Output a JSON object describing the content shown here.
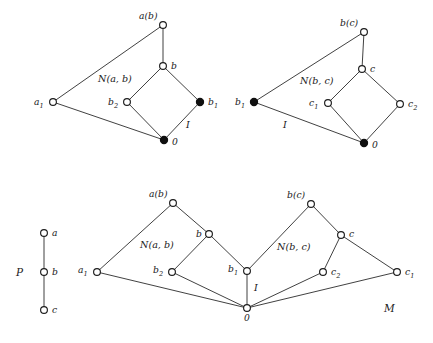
{
  "figure": {
    "background_color": "#ffffff",
    "line_color": "#2b2b2b",
    "node_open_fill": "#ffffff",
    "node_filled_fill": "#101010"
  },
  "chart_data": {
    "type": "diagram",
    "panels": [
      {
        "id": "panel-nab",
        "region_label": "N(a, b)",
        "interval_label": "I",
        "nodes": [
          {
            "id": "ab",
            "label": "a(b)",
            "x": 163,
            "y": 25,
            "filled": false,
            "label_dx": -24,
            "label_dy": -6
          },
          {
            "id": "b",
            "label": "b",
            "x": 163,
            "y": 66,
            "filled": false,
            "label_dx": 8,
            "label_dy": 3
          },
          {
            "id": "b2",
            "label": "b2",
            "x": 127,
            "y": 102,
            "filled": false,
            "label_dx": -19,
            "label_dy": 3
          },
          {
            "id": "b1",
            "label": "b1",
            "x": 200,
            "y": 102,
            "filled": true,
            "label_dx": 8,
            "label_dy": 3
          },
          {
            "id": "zero",
            "label": "0",
            "x": 164,
            "y": 140,
            "filled": true,
            "label_dx": 8,
            "label_dy": 5
          },
          {
            "id": "a1",
            "label": "a1",
            "x": 53,
            "y": 102,
            "filled": false,
            "label_dx": -19,
            "label_dy": 3
          }
        ],
        "edges": [
          [
            "ab",
            "b"
          ],
          [
            "b",
            "b2"
          ],
          [
            "b",
            "b1"
          ],
          [
            "b2",
            "zero"
          ],
          [
            "b1",
            "zero"
          ],
          [
            "a1",
            "ab"
          ],
          [
            "a1",
            "zero"
          ]
        ],
        "region_label_x": 98,
        "region_label_y": 82,
        "interval_label_x": 186,
        "interval_label_y": 128
      },
      {
        "id": "panel-nbc",
        "region_label": "N(b, c)",
        "interval_label": "I",
        "nodes": [
          {
            "id": "bc",
            "label": "b(c)",
            "x": 364,
            "y": 32,
            "filled": false,
            "label_dx": -24,
            "label_dy": -6
          },
          {
            "id": "c",
            "label": "c",
            "x": 362,
            "y": 69,
            "filled": false,
            "label_dx": 8,
            "label_dy": 3
          },
          {
            "id": "c1",
            "label": "c1",
            "x": 328,
            "y": 103,
            "filled": false,
            "label_dx": -19,
            "label_dy": 3
          },
          {
            "id": "c2",
            "label": "c2",
            "x": 400,
            "y": 104,
            "filled": false,
            "label_dx": 8,
            "label_dy": 3
          },
          {
            "id": "zero",
            "label": "0",
            "x": 364,
            "y": 143,
            "filled": true,
            "label_dx": 8,
            "label_dy": 5
          },
          {
            "id": "b1",
            "label": "b1",
            "x": 254,
            "y": 102,
            "filled": true,
            "label_dx": -19,
            "label_dy": 3
          }
        ],
        "edges": [
          [
            "bc",
            "c"
          ],
          [
            "c",
            "c1"
          ],
          [
            "c",
            "c2"
          ],
          [
            "c1",
            "zero"
          ],
          [
            "c2",
            "zero"
          ],
          [
            "b1",
            "bc"
          ],
          [
            "b1",
            "zero"
          ]
        ],
        "region_label_x": 300,
        "region_label_y": 84,
        "interval_label_x": 283,
        "interval_label_y": 128
      },
      {
        "id": "panel-p",
        "region_label": "P",
        "nodes": [
          {
            "id": "a",
            "label": "a",
            "x": 44,
            "y": 233,
            "filled": false,
            "label_dx": 8,
            "label_dy": 3
          },
          {
            "id": "b",
            "label": "b",
            "x": 44,
            "y": 272,
            "filled": false,
            "label_dx": 8,
            "label_dy": 3
          },
          {
            "id": "c",
            "label": "c",
            "x": 44,
            "y": 310,
            "filled": false,
            "label_dx": 8,
            "label_dy": 3
          }
        ],
        "edges": [
          [
            "a",
            "b"
          ],
          [
            "b",
            "c"
          ]
        ],
        "region_label_x": 16,
        "region_label_y": 276
      },
      {
        "id": "panel-m",
        "region_label": "M",
        "region_left_label": "N(a, b)",
        "region_right_label": "N(b, c)",
        "interval_label": "I",
        "nodes": [
          {
            "id": "ab",
            "label": "a(b)",
            "x": 173,
            "y": 203,
            "filled": false,
            "label_dx": -24,
            "label_dy": -6
          },
          {
            "id": "b",
            "label": "b",
            "x": 209,
            "y": 234,
            "filled": false,
            "label_dx": -13,
            "label_dy": 0
          },
          {
            "id": "b2",
            "label": "b2",
            "x": 172,
            "y": 272,
            "filled": false,
            "label_dx": -19,
            "label_dy": 1
          },
          {
            "id": "b1",
            "label": "b1",
            "x": 247,
            "y": 271,
            "filled": false,
            "label_dx": -19,
            "label_dy": 1
          },
          {
            "id": "a1",
            "label": "a1",
            "x": 97,
            "y": 272,
            "filled": false,
            "label_dx": -19,
            "label_dy": 1
          },
          {
            "id": "zero",
            "label": "0",
            "x": 247,
            "y": 308,
            "filled": false,
            "label_dx": -3,
            "label_dy": 13
          },
          {
            "id": "bc",
            "label": "b(c)",
            "x": 311,
            "y": 204,
            "filled": false,
            "label_dx": -24,
            "label_dy": -6
          },
          {
            "id": "c",
            "label": "c",
            "x": 341,
            "y": 235,
            "filled": false,
            "label_dx": 8,
            "label_dy": 2
          },
          {
            "id": "c2",
            "label": "c2",
            "x": 323,
            "y": 272,
            "filled": false,
            "label_dx": 8,
            "label_dy": 3
          },
          {
            "id": "c1",
            "label": "c1",
            "x": 397,
            "y": 272,
            "filled": false,
            "label_dx": 8,
            "label_dy": 3
          }
        ],
        "edges": [
          [
            "ab",
            "b"
          ],
          [
            "ab",
            "a1"
          ],
          [
            "b",
            "b2"
          ],
          [
            "b",
            "b1"
          ],
          [
            "b2",
            "zero"
          ],
          [
            "b1",
            "zero"
          ],
          [
            "a1",
            "zero"
          ],
          [
            "bc",
            "c"
          ],
          [
            "bc",
            "b1"
          ],
          [
            "c",
            "c2"
          ],
          [
            "c",
            "c1"
          ],
          [
            "c2",
            "zero"
          ],
          [
            "c1",
            "zero"
          ]
        ],
        "region_left_label_x": 140,
        "region_left_label_y": 248,
        "region_right_label_x": 277,
        "region_right_label_y": 250,
        "interval_label_x": 254,
        "interval_label_y": 291,
        "region_label_x": 384,
        "region_label_y": 312
      }
    ]
  }
}
